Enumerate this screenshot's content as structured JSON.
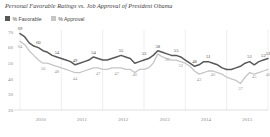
{
  "chart_data": {
    "type": "line",
    "title": "Personal Favorable Ratings vs. Job Approval of President Obama",
    "xlabel": "",
    "ylabel": "",
    "ylim": [
      20,
      70
    ],
    "yticks": [
      70,
      60,
      50,
      40,
      30,
      20
    ],
    "xticks": [
      "2010",
      "2011",
      "2012",
      "2013",
      "2014",
      "2015"
    ],
    "grid": "vertical",
    "legend_position": "top-left",
    "series": [
      {
        "name": "% Favorable",
        "color": "#595959",
        "values": [
          69,
          67,
          63,
          61,
          60,
          58,
          57,
          55,
          54,
          53,
          52,
          51,
          49,
          50,
          51,
          52,
          54,
          53,
          52,
          52,
          53,
          54,
          55,
          54,
          53,
          50,
          51,
          52,
          53,
          55,
          58,
          57,
          56,
          55,
          55,
          54,
          52,
          50,
          48,
          49,
          51,
          51,
          50,
          49,
          47,
          46,
          46,
          47,
          48,
          50,
          51,
          49,
          51,
          52,
          53
        ],
        "point_labels": [
          {
            "index": 0,
            "value": 69
          },
          {
            "index": 4,
            "value": 60
          },
          {
            "index": 8,
            "value": 54
          },
          {
            "index": 12,
            "value": 49
          },
          {
            "index": 16,
            "value": 54
          },
          {
            "index": 22,
            "value": 55
          },
          {
            "index": 27,
            "value": 53
          },
          {
            "index": 30,
            "value": 58
          },
          {
            "index": 34,
            "value": 55
          },
          {
            "index": 38,
            "value": 48
          },
          {
            "index": 41,
            "value": 51
          },
          {
            "index": 50,
            "value": 51
          },
          {
            "index": 53,
            "value": 52
          },
          {
            "index": 54,
            "value": 53
          }
        ]
      },
      {
        "name": "% Approval",
        "color": "#c6c6c6",
        "values": [
          64,
          62,
          58,
          55,
          52,
          50,
          50,
          49,
          48,
          47,
          46,
          45,
          44,
          44,
          45,
          46,
          47,
          47,
          46,
          46,
          47,
          47,
          47,
          46,
          46,
          44,
          46,
          46,
          47,
          50,
          56,
          54,
          53,
          52,
          52,
          51,
          50,
          48,
          45,
          43,
          44,
          45,
          45,
          44,
          43,
          41,
          40,
          39,
          37,
          41,
          44,
          43,
          44,
          45,
          46
        ],
        "point_labels": [
          {
            "index": 0,
            "value": 64
          },
          {
            "index": 5,
            "value": 50
          },
          {
            "index": 8,
            "value": 48
          },
          {
            "index": 12,
            "value": 44
          },
          {
            "index": 17,
            "value": 47
          },
          {
            "index": 21,
            "value": 47
          },
          {
            "index": 25,
            "value": 46
          },
          {
            "index": 32,
            "value": 56
          },
          {
            "index": 35,
            "value": 52
          },
          {
            "index": 39,
            "value": 43
          },
          {
            "index": 42,
            "value": 46
          },
          {
            "index": 48,
            "value": 37
          },
          {
            "index": 51,
            "value": 45
          },
          {
            "index": 54,
            "value": 46
          }
        ]
      }
    ]
  },
  "legend": {
    "items": [
      {
        "label": "% Favorable",
        "color": "#595959"
      },
      {
        "label": "% Approval",
        "color": "#c6c6c6"
      }
    ]
  }
}
